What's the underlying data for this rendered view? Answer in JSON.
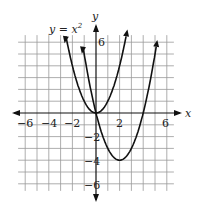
{
  "chart_data": {
    "type": "line",
    "title": "",
    "xlabel": "x",
    "ylabel": "y",
    "xlim": [
      -6.5,
      6.5
    ],
    "ylim": [
      -6.5,
      6.5
    ],
    "grid": true,
    "x_ticks": [
      "-6",
      "-4",
      "-2",
      "2",
      "6"
    ],
    "y_ticks": [
      "6",
      "-2",
      "-4",
      "-6"
    ],
    "annotations": [
      "y = x²"
    ],
    "series": [
      {
        "name": "y = x²",
        "equation": "y = x^2",
        "vertex": [
          0,
          0
        ],
        "x_range": [
          -2.55,
          2.55
        ]
      },
      {
        "name": "y = (x-2)² - 4",
        "equation": "y = x^2 - 4x",
        "vertex": [
          2,
          -4
        ],
        "x_range": [
          -1.1,
          5.1
        ],
        "x_intercepts": [
          0,
          4
        ]
      }
    ]
  },
  "labels": {
    "x_axis": "x",
    "y_axis": "y",
    "curve_label": "y = x",
    "curve_label_exp": "2",
    "xt_m6": "−6",
    "xt_m4": "−4",
    "xt_m2": "−2",
    "xt_2": "2",
    "xt_6": "6",
    "yt_6": "6",
    "yt_m2": "−2",
    "yt_m4": "−4",
    "yt_m6": "−6"
  }
}
